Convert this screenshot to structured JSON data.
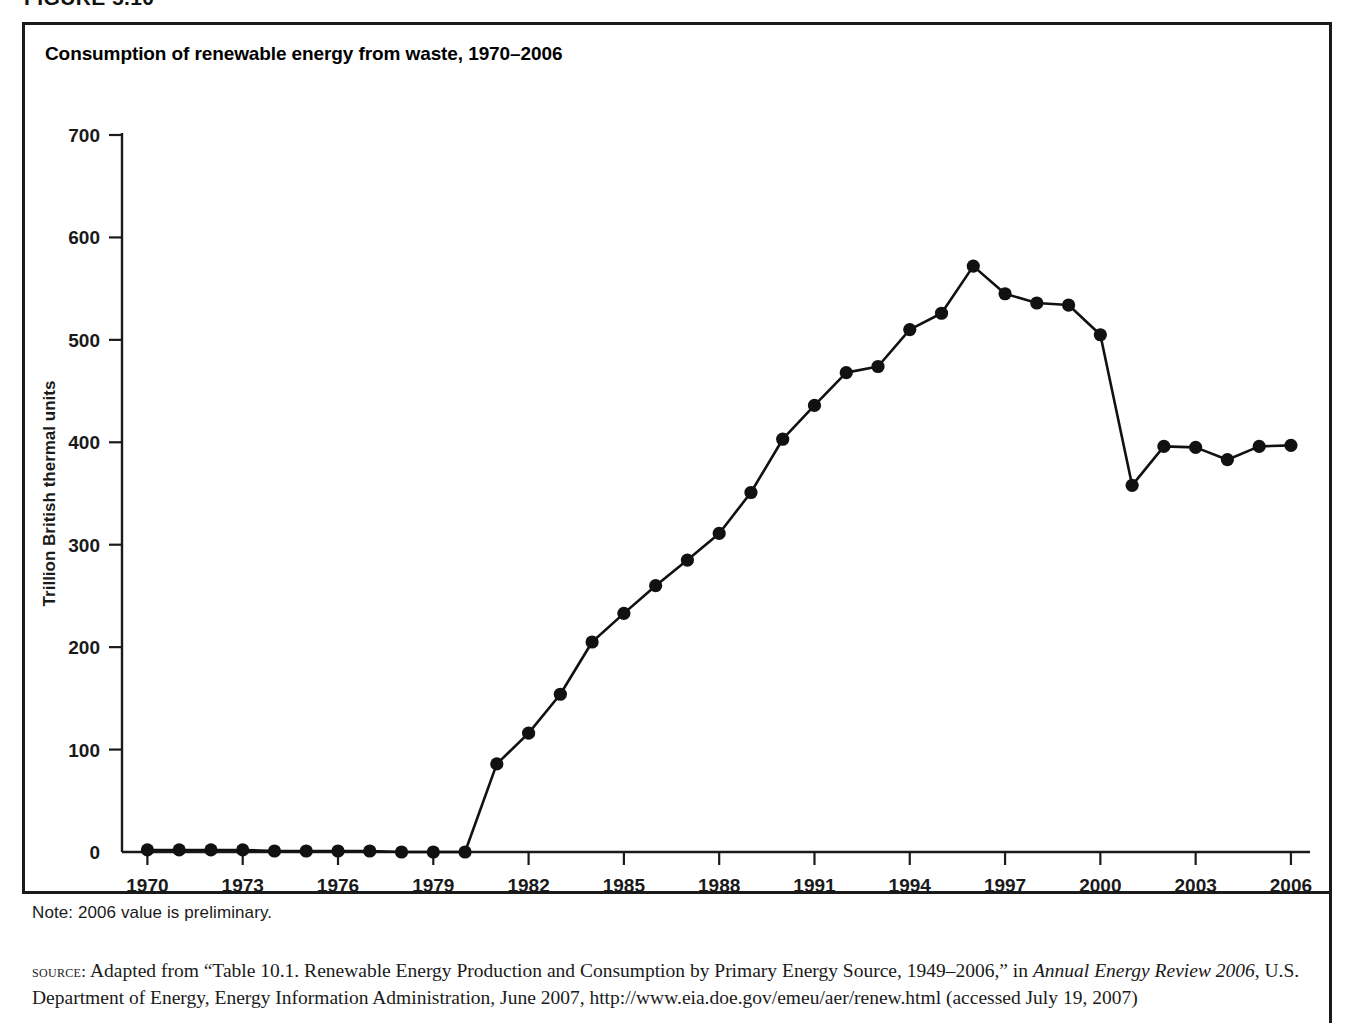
{
  "figure": {
    "label": "FIGURE 5.10"
  },
  "chart_title": "Consumption of renewable energy from waste, 1970–2006",
  "note": "Note: 2006 value is preliminary.",
  "source": {
    "kicker": "source:",
    "part1": " Adapted from “Table 10.1. Renewable Energy Production and Consumption by Primary Energy Source, 1949–2006,” in ",
    "italic1": "Annual Energy Review 2006",
    "part2": ", U.S. Department of Energy, Energy Information Administration, June 2007, http://www.eia.doe.gov/emeu/aer/renew.html (accessed July 19, 2007)"
  },
  "colors": {
    "line": "#111111",
    "marker": "#111111",
    "axis": "#1a1a1a",
    "border": "#1a1a1a",
    "background": "#ffffff"
  },
  "chart_data": {
    "type": "line",
    "title": "Consumption of renewable energy from waste, 1970–2006",
    "xlabel": "",
    "ylabel": "Trillion British thermal units",
    "xlim": [
      1969.2,
      2006.6
    ],
    "ylim": [
      0,
      700
    ],
    "yticks": [
      0,
      100,
      200,
      300,
      400,
      500,
      600,
      700
    ],
    "ytick_labels": [
      "0",
      "100",
      "200",
      "300",
      "400",
      "500",
      "600",
      "700"
    ],
    "xticks": [
      1970,
      1973,
      1976,
      1979,
      1982,
      1985,
      1988,
      1991,
      1994,
      1997,
      2000,
      2003,
      2006
    ],
    "xtick_labels": [
      "1970",
      "1973",
      "1976",
      "1979",
      "1982",
      "1985",
      "1988",
      "1991",
      "1994",
      "1997",
      "2000",
      "2003",
      "2006"
    ],
    "grid": false,
    "legend": false,
    "markers": true,
    "x": [
      1970,
      1971,
      1972,
      1973,
      1974,
      1975,
      1976,
      1977,
      1978,
      1979,
      1980,
      1981,
      1982,
      1983,
      1984,
      1985,
      1986,
      1987,
      1988,
      1989,
      1990,
      1991,
      1992,
      1993,
      1994,
      1995,
      1996,
      1997,
      1998,
      1999,
      2000,
      2001,
      2002,
      2003,
      2004,
      2005,
      2006
    ],
    "values": [
      2,
      2,
      2,
      2,
      1,
      1,
      1,
      1,
      0,
      0,
      0,
      86,
      116,
      154,
      205,
      233,
      260,
      285,
      311,
      351,
      403,
      436,
      468,
      474,
      510,
      526,
      572,
      545,
      536,
      534,
      505,
      358,
      396,
      395,
      383,
      396,
      397
    ],
    "series": [
      {
        "name": "Waste energy consumption",
        "values": [
          2,
          2,
          2,
          2,
          1,
          1,
          1,
          1,
          0,
          0,
          0,
          86,
          116,
          154,
          205,
          233,
          260,
          285,
          311,
          351,
          403,
          436,
          468,
          474,
          510,
          526,
          572,
          545,
          536,
          534,
          505,
          358,
          396,
          395,
          383,
          396,
          397
        ]
      }
    ]
  }
}
